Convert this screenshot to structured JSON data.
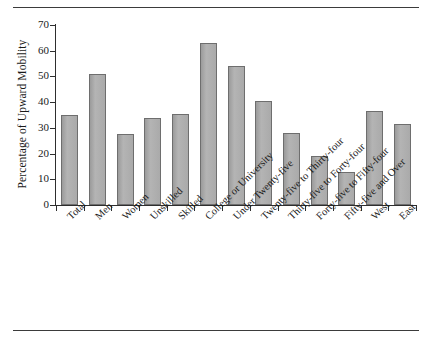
{
  "chart_data": {
    "type": "bar",
    "title": "",
    "xlabel": "",
    "ylabel": "Percentage of Upward Mobility",
    "ylim": [
      0,
      70
    ],
    "yticks": [
      0,
      10,
      20,
      30,
      40,
      50,
      60,
      70
    ],
    "grid": false,
    "legend": null,
    "bar_color": "#a9a9a9",
    "bar_edge_color": "#6e6e6e",
    "categories": [
      "Total",
      "Men",
      "Women",
      "Unskilled",
      "Skilled",
      "College or University",
      "Under Twenty-five",
      "Twenty-five to Thirty-four",
      "Thirty-five to Forty-four",
      "Forty-five to Fifty-four",
      "Fifty-five and Over",
      "West",
      "East"
    ],
    "values": [
      35,
      51,
      27.5,
      34,
      35.5,
      63,
      54,
      40.5,
      28,
      19,
      13,
      36.5,
      31.5
    ]
  },
  "figure": {
    "rule_color": "#3b3b3b"
  }
}
